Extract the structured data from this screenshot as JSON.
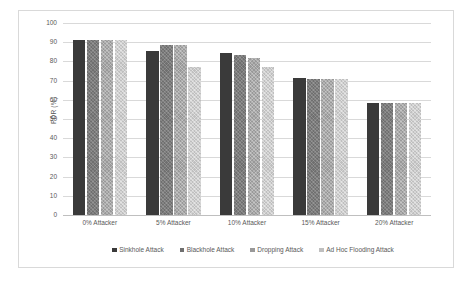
{
  "chart_data": {
    "type": "bar",
    "title": "",
    "xlabel": "",
    "ylabel": "PDR (%)",
    "ylim": [
      0,
      100
    ],
    "ytick_step": 10,
    "yticks": [
      100,
      90,
      80,
      70,
      60,
      50,
      40,
      30,
      20,
      10,
      0
    ],
    "grid": true,
    "legend_position": "bottom",
    "categories": [
      "0% Attacker",
      "5% Attacker",
      "10% Attacker",
      "15% Attacker",
      "20% Attacker"
    ],
    "series": [
      {
        "name": "Sinkhole Attack",
        "color": "#3a3a3a",
        "values": [
          91,
          85.3,
          84.5,
          71.2,
          58.6
        ]
      },
      {
        "name": "Blackhole Attack",
        "color": "#6f6f6f",
        "values": [
          91,
          88.3,
          83.2,
          70.6,
          58.4
        ]
      },
      {
        "name": "Dropping Attack",
        "color": "#999999",
        "values": [
          91,
          88.7,
          82.0,
          71.0,
          58.6
        ]
      },
      {
        "name": "Ad Hoc Flooding Attack",
        "color": "#bfbfbf",
        "values": [
          91,
          77.0,
          77.2,
          70.6,
          58.4
        ]
      }
    ]
  },
  "axis": {
    "y_title": "PDR (%)"
  }
}
